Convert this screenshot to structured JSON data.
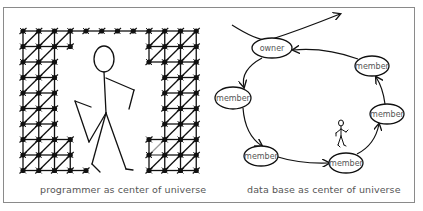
{
  "left_panel": {
    "caption": "programmer as center of universe",
    "grid": {
      "origin_x": 23,
      "origin_y": 31,
      "spacing_x": 15.75,
      "spacing_y": 15.5,
      "columns": 12,
      "rows": 10,
      "rows_mask": [
        "111111111111",
        "11110000111111",
        "111000001111",
        "111000000111",
        "111000000111",
        "111000000111",
        "111000000111",
        "111100001111",
        "111100001111",
        "111110001111"
      ],
      "highlight_color": "#9a9a9a"
    },
    "figure": "walking-stick-figure"
  },
  "right_panel": {
    "caption": "data base as center of universe",
    "nodes": [
      {
        "id": "owner",
        "label": "owner",
        "cx": 272,
        "cy": 48,
        "rx": 20,
        "ry": 10
      },
      {
        "id": "m1",
        "label": "member",
        "cx": 372,
        "cy": 66,
        "rx": 17,
        "ry": 10
      },
      {
        "id": "m2",
        "label": "member",
        "cx": 387,
        "cy": 114,
        "rx": 17,
        "ry": 10
      },
      {
        "id": "m3",
        "label": "member",
        "cx": 346,
        "cy": 163,
        "rx": 17,
        "ry": 10
      },
      {
        "id": "m4",
        "label": "member",
        "cx": 261,
        "cy": 156,
        "rx": 17,
        "ry": 10
      },
      {
        "id": "m5",
        "label": "member",
        "cx": 233,
        "cy": 98,
        "rx": 18,
        "ry": 11
      }
    ],
    "figure": "small-stick-figure"
  },
  "colors": {
    "line": "#111111",
    "frame": "#8a8a8a",
    "caption": "#555555"
  }
}
